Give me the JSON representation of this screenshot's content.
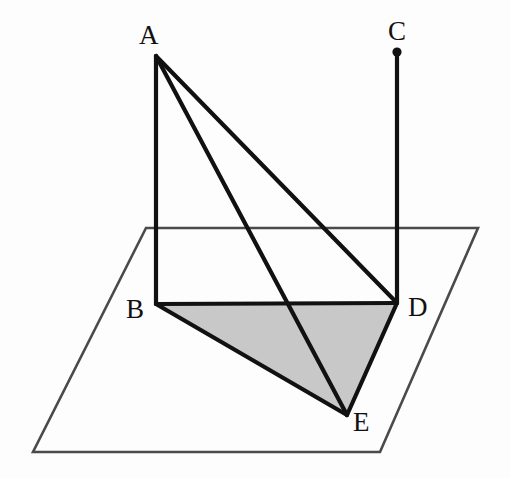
{
  "figure": {
    "type": "solid-geometry-diagram",
    "width": 510,
    "height": 478,
    "background_color": "#fdfdfd"
  },
  "style": {
    "solid_line_color": "#111111",
    "solid_line_width": 4.2,
    "plane_line_color": "#4a4a4a",
    "plane_line_width": 2.6,
    "shade_fill_color": "#c8c8c8",
    "point_marker_color": "#111111",
    "label_color": "#111111",
    "label_font_size": "27px"
  },
  "points": {
    "A": {
      "label": "A",
      "x": 156,
      "y": 56,
      "label_x": 139,
      "label_y": 22
    },
    "B": {
      "label": "B",
      "x": 156,
      "y": 304,
      "label_x": 126,
      "label_y": 296
    },
    "C": {
      "label": "C",
      "x": 397,
      "y": 52,
      "label_x": 388,
      "label_y": 18
    },
    "D": {
      "label": "D",
      "x": 397,
      "y": 303,
      "label_x": 408,
      "label_y": 294
    },
    "E": {
      "label": "E",
      "x": 347,
      "y": 415,
      "label_x": 353,
      "label_y": 409
    }
  },
  "plane": {
    "name": "horizontal-reference-plane",
    "corners": [
      {
        "x": 146,
        "y": 228
      },
      {
        "x": 478,
        "y": 228
      },
      {
        "x": 380,
        "y": 452
      },
      {
        "x": 33,
        "y": 452
      }
    ],
    "polygon_points": "146,228 478,228 380,452 33,452"
  },
  "shaded_region": {
    "name": "triangle-BDE",
    "vertices": [
      "B",
      "D",
      "E"
    ],
    "polygon_points": "156,304 397,303 347,415",
    "fill": "#c8c8c8"
  },
  "edges": [
    {
      "name": "edge-AB",
      "from": "A",
      "to": "B",
      "x1": 156,
      "y1": 56,
      "x2": 156,
      "y2": 304
    },
    {
      "name": "edge-AD",
      "from": "A",
      "to": "D",
      "x1": 156,
      "y1": 56,
      "x2": 397,
      "y2": 303
    },
    {
      "name": "edge-AE",
      "from": "A",
      "to": "E",
      "x1": 156,
      "y1": 56,
      "x2": 347,
      "y2": 415
    },
    {
      "name": "edge-CD",
      "from": "C",
      "to": "D",
      "x1": 397,
      "y1": 52,
      "x2": 397,
      "y2": 303
    },
    {
      "name": "edge-BD",
      "from": "B",
      "to": "D",
      "x1": 156,
      "y1": 304,
      "x2": 397,
      "y2": 303
    },
    {
      "name": "edge-BE",
      "from": "B",
      "to": "E",
      "x1": 156,
      "y1": 304,
      "x2": 347,
      "y2": 415
    },
    {
      "name": "edge-DE",
      "from": "D",
      "to": "E",
      "x1": 397,
      "y1": 303,
      "x2": 347,
      "y2": 415
    }
  ],
  "markers": [
    {
      "name": "point-marker-C",
      "at": "C",
      "x": 397,
      "y": 52,
      "r": 4.6
    }
  ]
}
